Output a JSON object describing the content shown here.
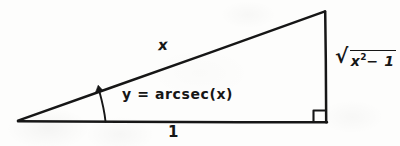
{
  "figure": {
    "type": "right-triangle-diagram",
    "background_color": "#fdfdfc",
    "ink_color": "#161616",
    "width": 400,
    "height": 146,
    "vertices": {
      "left": [
        18,
        121
      ],
      "bottom_right": [
        326,
        122
      ],
      "apex": [
        325,
        11
      ]
    },
    "sides": {
      "hypotenuse_label": "x",
      "base_label": "1",
      "opposite": {
        "radical_symbol": "√",
        "radicand_base": "x",
        "radicand_exponent": "2",
        "radicand_rest": "− 1",
        "full_text": "√(x² − 1)"
      }
    },
    "angle": {
      "equation": "y = arcsec(x)",
      "marker": "curved-arrow-arc",
      "at_vertex": "left"
    },
    "right_angle_marker": {
      "present": true,
      "at_vertex": "bottom_right",
      "size": 11
    }
  }
}
